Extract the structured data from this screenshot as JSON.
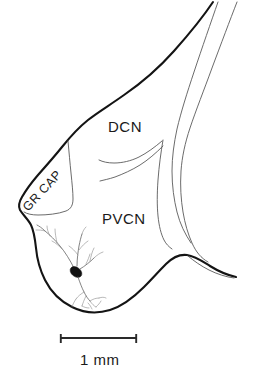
{
  "figure": {
    "type": "anatomical-line-drawing",
    "background_color": "#ffffff",
    "outline_color": "#141414",
    "inner_line_color": "#5a5a5a",
    "neuron_color": "#6e6e6e",
    "soma_color": "#111111",
    "text_color": "#1a1a1a"
  },
  "labels": {
    "dcn": "DCN",
    "pvcn": "PVCN",
    "gr_cap": "GR CAP"
  },
  "scale": {
    "value": "1 mm",
    "bar_length_px": 77,
    "bar_x_start": 60,
    "bar_x_end": 137,
    "bar_y": 338
  },
  "neuron": {
    "name": "labeled-neuron",
    "soma_x": 75,
    "soma_y": 272,
    "description": "filled dark soma with thin branching dendrites and descending axon arborization"
  }
}
